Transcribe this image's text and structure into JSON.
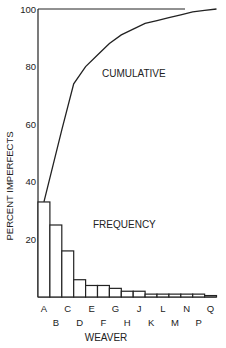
{
  "chart_data": {
    "type": "bar",
    "title": "",
    "xlabel": "WEAVER",
    "ylabel": "PERCENT IMPERFECTS",
    "ylim": [
      0,
      100
    ],
    "yticks": [
      20,
      40,
      60,
      80,
      100
    ],
    "grid": false,
    "categories": [
      "A",
      "B",
      "C",
      "D",
      "E",
      "F",
      "G",
      "H",
      "J",
      "K",
      "L",
      "M",
      "N",
      "P",
      "Q"
    ],
    "series": [
      {
        "name": "FREQUENCY",
        "type": "bar",
        "values": [
          33,
          25,
          16,
          6,
          4,
          4,
          3,
          2,
          2,
          1,
          1,
          1,
          1,
          1,
          0.5
        ]
      },
      {
        "name": "CUMULATIVE",
        "type": "line",
        "values": [
          33,
          58,
          74,
          80,
          84,
          88,
          91,
          93,
          95,
          96,
          97,
          98,
          99,
          99.5,
          100
        ]
      }
    ],
    "annotations": [
      {
        "text": "CUMULATIVE",
        "near": "line"
      },
      {
        "text": "FREQUENCY",
        "near": "bars"
      }
    ],
    "reference_line": {
      "y": 100
    }
  },
  "labels": {
    "xlabel": "WEAVER",
    "ylabel": "PERCENT IMPERFECTS",
    "cumulative": "CUMULATIVE",
    "frequency": "FREQUENCY"
  }
}
